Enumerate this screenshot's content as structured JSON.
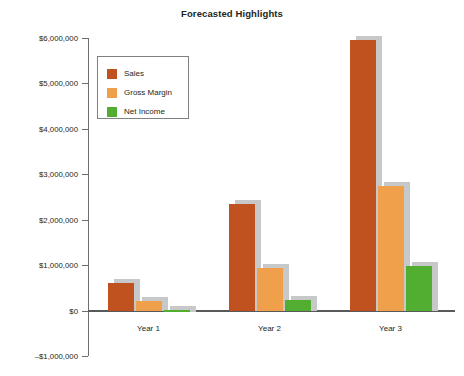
{
  "chart_data": {
    "type": "bar",
    "title": "Forecasted Highlights",
    "xlabel": "",
    "ylabel": "",
    "categories": [
      "Year 1",
      "Year 2",
      "Year 3"
    ],
    "series": [
      {
        "name": "Sales",
        "color": "#c0521f",
        "values": [
          600000,
          2350000,
          5950000
        ]
      },
      {
        "name": "Gross Margin",
        "color": "#f0a04b",
        "values": [
          220000,
          930000,
          2750000
        ]
      },
      {
        "name": "Net Income",
        "color": "#52ae31",
        "values": [
          10000,
          230000,
          980000
        ]
      }
    ],
    "ylim": [
      -1000000,
      6000000
    ],
    "ytick_labels": [
      "$6,000,000",
      "$5,000,000",
      "$4,000,000",
      "$3,000,000",
      "$2,000,000",
      "$1,000,000",
      "$0",
      "–$1,000,000"
    ],
    "ytick_values": [
      6000000,
      5000000,
      4000000,
      3000000,
      2000000,
      1000000,
      0,
      -1000000
    ],
    "grid": false,
    "legend_position": "upper left",
    "legend_entries": [
      "Sales",
      "Gross Margin",
      "Net Income"
    ]
  }
}
